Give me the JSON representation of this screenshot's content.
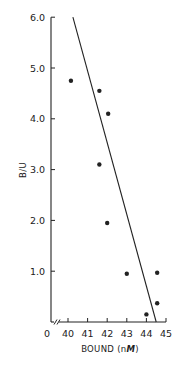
{
  "chart_data": {
    "type": "scatter",
    "title": "",
    "xlabel": "BOUND (nM)",
    "xlabel_parts": [
      "BOUND (n",
      "M",
      ")"
    ],
    "ylabel": "B/U",
    "xlim": [
      40,
      45
    ],
    "ylim": [
      0,
      6.0
    ],
    "x_axis_break": true,
    "x_origin_label": "0",
    "x_ticks": [
      40,
      41,
      42,
      43,
      44,
      45
    ],
    "x_tick_labels": [
      "40",
      "41",
      "42",
      "43",
      "44",
      "45"
    ],
    "y_ticks": [
      1.0,
      2.0,
      3.0,
      4.0,
      5.0,
      6.0
    ],
    "y_tick_labels": [
      "1.0",
      "2.0",
      "3.0",
      "4.0",
      "5.0",
      "6.0"
    ],
    "grid": false,
    "legend": null,
    "series": [
      {
        "name": "data points",
        "kind": "scatter",
        "points": [
          {
            "x": 40.15,
            "y": 4.75
          },
          {
            "x": 41.6,
            "y": 4.55
          },
          {
            "x": 42.05,
            "y": 4.1
          },
          {
            "x": 41.6,
            "y": 3.1
          },
          {
            "x": 42.0,
            "y": 1.95
          },
          {
            "x": 43.0,
            "y": 0.95
          },
          {
            "x": 44.55,
            "y": 0.97
          },
          {
            "x": 44.55,
            "y": 0.37
          },
          {
            "x": 44.0,
            "y": 0.15
          }
        ]
      },
      {
        "name": "fit line",
        "kind": "line",
        "points": [
          {
            "x": 40.25,
            "y": 6.0
          },
          {
            "x": 44.5,
            "y": 0.0
          }
        ]
      }
    ],
    "colors": {
      "ink": "#222222",
      "background": "#ffffff"
    }
  }
}
